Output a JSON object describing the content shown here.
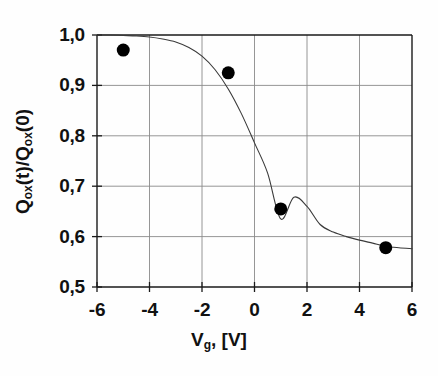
{
  "chart_data": {
    "type": "scatter",
    "title": "",
    "xlabel": "V_g, [V]",
    "ylabel": "Q_ox(t)/Q_ox(0)",
    "xlabel_parts": {
      "main": "V",
      "sub": "g",
      "tail": ", [V]"
    },
    "ylabel_parts": {
      "q1": "Q",
      "sub1": "ox",
      "mid": "(t)/Q",
      "sub2": "ox",
      "tail": "(0)"
    },
    "xlim": [
      -6,
      6
    ],
    "ylim": [
      0.5,
      1.0
    ],
    "xticks": [
      -6,
      -4,
      -2,
      0,
      2,
      4,
      6
    ],
    "xtick_labels": [
      "-6",
      "-4",
      "-2",
      "0",
      "2",
      "4",
      "6"
    ],
    "yticks": [
      0.5,
      0.6,
      0.7,
      0.8,
      0.9,
      1.0
    ],
    "ytick_labels": [
      "0,5",
      "0,6",
      "0,7",
      "0,8",
      "0,9",
      "1,0"
    ],
    "grid": true,
    "legend": "none",
    "decimal_separator": ",",
    "series": [
      {
        "name": "measured",
        "type": "scatter",
        "marker": "filled-circle",
        "marker_color": "#000000",
        "marker_size": 13,
        "x": [
          -5,
          -1,
          1,
          5
        ],
        "values": [
          0.97,
          0.925,
          0.655,
          0.578
        ]
      },
      {
        "name": "sigmoid-fit",
        "type": "line",
        "line_color": "#3a3a3a",
        "line_width": 1.1,
        "x": [
          -6.0,
          -5.5,
          -5.0,
          -4.5,
          -4.0,
          -3.5,
          -3.0,
          -2.5,
          -2.0,
          -1.5,
          -1.0,
          -0.5,
          0.0,
          0.5,
          1.0,
          1.5,
          2.0,
          2.5,
          3.0,
          3.5,
          4.0,
          4.5,
          5.0,
          5.5,
          6.0
        ],
        "values": [
          1.0,
          1.0,
          0.999,
          0.998,
          0.996,
          0.992,
          0.986,
          0.975,
          0.958,
          0.931,
          0.893,
          0.844,
          0.786,
          0.726,
          0.635,
          0.678,
          0.66,
          0.624,
          0.609,
          0.6,
          0.593,
          0.587,
          0.581,
          0.578,
          0.576
        ]
      }
    ],
    "colors": {
      "axis": "#1a1a1a",
      "grid": "#8a8a8a",
      "marker": "#000000",
      "curve": "#3a3a3a",
      "background": "#fefefe"
    }
  },
  "geometry": {
    "plot_left": 97,
    "plot_right": 412,
    "plot_top": 35,
    "plot_bottom": 287
  }
}
